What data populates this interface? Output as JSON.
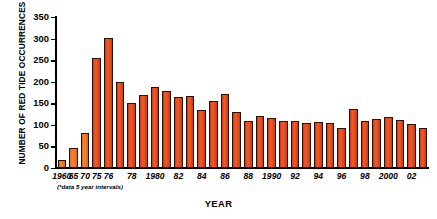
{
  "chart_data": {
    "type": "bar",
    "title": "",
    "xlabel": "YEAR",
    "ylabel": "NUMBER OF RED TIDE OCCURRENCES",
    "ylim": [
      0,
      350
    ],
    "ytick_values": [
      0,
      50,
      100,
      150,
      200,
      250,
      300,
      350
    ],
    "ytick_labels": [
      "0",
      "50",
      "100",
      "150",
      "200",
      "250",
      "300",
      "350"
    ],
    "grid": false,
    "legend": null,
    "footnote": "(*data 5 year intervals)",
    "categories": [
      "1960",
      "65",
      "70",
      "75",
      "76",
      "77",
      "78",
      "79",
      "1980",
      "81",
      "82",
      "83",
      "84",
      "85",
      "86",
      "87",
      "88",
      "89",
      "1990",
      "91",
      "92",
      "93",
      "94",
      "95",
      "96",
      "97",
      "98",
      "99",
      "2000",
      "01",
      "02",
      "03"
    ],
    "values": [
      18,
      47,
      82,
      254,
      301,
      199,
      150,
      170,
      188,
      178,
      164,
      166,
      135,
      156,
      172,
      129,
      110,
      121,
      115,
      108,
      110,
      104,
      106,
      104,
      93,
      137,
      108,
      114,
      118,
      111,
      101,
      93
    ],
    "xtick_labels": [
      "1960",
      "65",
      "70",
      "75",
      "76",
      "78",
      "1980",
      "82",
      "84",
      "86",
      "88",
      "1990",
      "92",
      "94",
      "96",
      "98",
      "2000",
      "02"
    ],
    "xtick_indices": [
      0,
      1,
      2,
      3,
      4,
      6,
      8,
      10,
      12,
      14,
      16,
      18,
      20,
      22,
      24,
      26,
      28,
      30
    ],
    "bar_color": "#e8491f",
    "bar_color_light": "#ee8433",
    "bar_outline_color": "#2b1206",
    "axis_color": "#000000",
    "background_color": "#ffffff"
  }
}
